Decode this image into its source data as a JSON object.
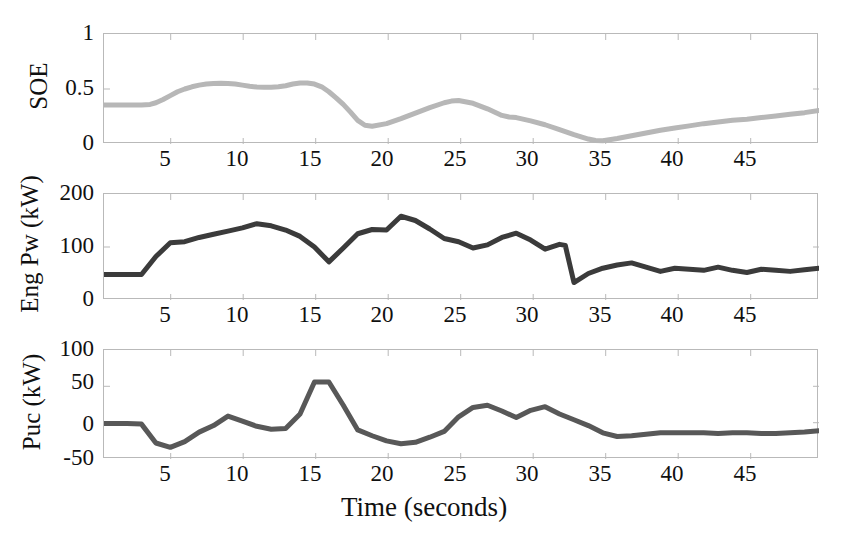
{
  "figure": {
    "width": 848,
    "height": 548,
    "background": "#ffffff",
    "xlabel": "Time (seconds)",
    "xtick_labels": [
      "5",
      "10",
      "15",
      "20",
      "25",
      "30",
      "35",
      "40",
      "45"
    ],
    "xtick_values": [
      5,
      10,
      15,
      20,
      25,
      30,
      35,
      40,
      45
    ],
    "xlim": [
      0.4,
      50
    ]
  },
  "panels": {
    "soe": {
      "ylabel": "SOE",
      "ytick_labels": [
        "0",
        "0.5",
        "1"
      ],
      "ytick_values": [
        0,
        0.5,
        1
      ],
      "color": "#b7b7b7",
      "linewidth": 5
    },
    "engpw": {
      "ylabel": "Eng Pw (kW)",
      "ytick_labels": [
        "0",
        "100",
        "200"
      ],
      "ytick_values": [
        0,
        100,
        200
      ],
      "color": "#3b3b3b",
      "linewidth": 5
    },
    "puc": {
      "ylabel": "Puc (kW)",
      "ytick_labels": [
        "-50",
        "0",
        "50",
        "100"
      ],
      "ytick_values": [
        -50,
        0,
        50,
        100
      ],
      "color": "#585858",
      "linewidth": 5
    }
  },
  "chart_data": [
    {
      "type": "line",
      "title": "",
      "name": "soe",
      "xlabel": "",
      "ylabel": "SOE",
      "xlim": [
        0.4,
        50
      ],
      "ylim": [
        0,
        1
      ],
      "grid": false,
      "legend": "none",
      "color": "#b7b7b7",
      "x": [
        0.4,
        1,
        2,
        3,
        3.6,
        4,
        4.5,
        5,
        5.5,
        6,
        6.5,
        7,
        7.5,
        8,
        8.5,
        9,
        9.5,
        10,
        10.5,
        11,
        11.5,
        12,
        12.5,
        13,
        13.5,
        14,
        14.5,
        15,
        15.5,
        16,
        16.5,
        17,
        17.5,
        18,
        18.5,
        19,
        20,
        21,
        22,
        23,
        24,
        24.5,
        25,
        26,
        27,
        28,
        28.5,
        29,
        30,
        31,
        32,
        33,
        34,
        34.5,
        35,
        36,
        37,
        38,
        39,
        40,
        41,
        42,
        43,
        44,
        45,
        46,
        47,
        48,
        49,
        50
      ],
      "y": [
        0.355,
        0.355,
        0.355,
        0.355,
        0.36,
        0.375,
        0.405,
        0.44,
        0.475,
        0.5,
        0.52,
        0.535,
        0.545,
        0.55,
        0.552,
        0.55,
        0.545,
        0.535,
        0.525,
        0.518,
        0.515,
        0.515,
        0.52,
        0.53,
        0.545,
        0.555,
        0.555,
        0.545,
        0.52,
        0.475,
        0.42,
        0.36,
        0.29,
        0.215,
        0.17,
        0.162,
        0.185,
        0.23,
        0.28,
        0.33,
        0.375,
        0.39,
        0.395,
        0.37,
        0.32,
        0.26,
        0.245,
        0.24,
        0.21,
        0.175,
        0.13,
        0.085,
        0.045,
        0.032,
        0.03,
        0.05,
        0.075,
        0.1,
        0.125,
        0.145,
        0.165,
        0.185,
        0.2,
        0.215,
        0.225,
        0.24,
        0.255,
        0.27,
        0.285,
        0.305
      ]
    },
    {
      "type": "line",
      "title": "",
      "name": "engpw",
      "xlabel": "",
      "ylabel": "Eng Pw (kW)",
      "xlim": [
        0.4,
        50
      ],
      "ylim": [
        0,
        200
      ],
      "grid": false,
      "legend": "none",
      "color": "#3b3b3b",
      "x": [
        0.4,
        1,
        2,
        3,
        4,
        5,
        6,
        7,
        8,
        9,
        10,
        11,
        12,
        13,
        14,
        15,
        16,
        17,
        18,
        19,
        20,
        21,
        22,
        23,
        24,
        25,
        26,
        27,
        28,
        29,
        30,
        31,
        32,
        32.4,
        33,
        34,
        35,
        36,
        37,
        38,
        39,
        40,
        41,
        42,
        43,
        44,
        45,
        46,
        47,
        48,
        49,
        50
      ],
      "y": [
        48,
        48,
        48,
        48,
        82,
        108,
        110,
        118,
        124,
        130,
        136,
        144,
        140,
        132,
        120,
        100,
        72,
        98,
        125,
        133,
        132,
        158,
        150,
        134,
        116,
        110,
        98,
        104,
        118,
        126,
        113,
        96,
        105,
        103,
        33,
        50,
        60,
        66,
        70,
        62,
        54,
        60,
        58,
        56,
        62,
        56,
        52,
        58,
        56,
        54,
        57,
        60
      ]
    },
    {
      "type": "line",
      "title": "",
      "name": "puc",
      "xlabel": "Time (seconds)",
      "ylabel": "Puc (kW)",
      "xlim": [
        0.4,
        50
      ],
      "ylim": [
        -50,
        100
      ],
      "grid": false,
      "legend": "none",
      "color": "#585858",
      "x": [
        0.4,
        1,
        2,
        3,
        4,
        5,
        6,
        7,
        8,
        9,
        10,
        11,
        12,
        13,
        14,
        15,
        16,
        17,
        18,
        19,
        20,
        21,
        22,
        23,
        24,
        25,
        26,
        27,
        28,
        29,
        30,
        31,
        32,
        33,
        34,
        35,
        36,
        37,
        38,
        39,
        40,
        41,
        42,
        43,
        44,
        45,
        46,
        47,
        48,
        49,
        50
      ],
      "y": [
        -1,
        -1,
        -1,
        -2,
        -28,
        -34,
        -26,
        -13,
        -4,
        9,
        2,
        -5,
        -9,
        -8,
        12,
        56,
        56,
        24,
        -10,
        -18,
        -25,
        -29,
        -27,
        -20,
        -12,
        8,
        21,
        24,
        16,
        7,
        17,
        22,
        12,
        4,
        -4,
        -14,
        -19,
        -18,
        -16,
        -14,
        -14,
        -14,
        -14,
        -15,
        -14,
        -14,
        -15,
        -15,
        -14,
        -13,
        -11
      ]
    }
  ]
}
